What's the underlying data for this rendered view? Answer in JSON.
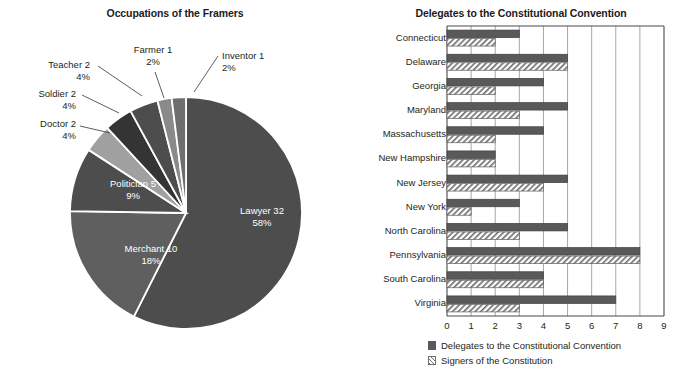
{
  "chart_data": [
    {
      "type": "pie",
      "title": "Occupations of the Framers",
      "categories": [
        "Lawyer",
        "Merchant",
        "Politician",
        "Doctor",
        "Soldier",
        "Teacher",
        "Farmer",
        "Inventor"
      ],
      "values": [
        32,
        10,
        5,
        2,
        2,
        2,
        1,
        1
      ],
      "percents": [
        "58%",
        "18%",
        "9%",
        "4%",
        "4%",
        "4%",
        "2%",
        "2%"
      ],
      "slices": [
        {
          "label": "Lawyer 32",
          "percent": "58%",
          "name": "Lawyer",
          "value": 32,
          "pct": 58,
          "color": "#4d4d4d",
          "placement": "inside"
        },
        {
          "label": "Merchant 10",
          "percent": "18%",
          "name": "Merchant",
          "value": 10,
          "pct": 18,
          "color": "#5f5f5f",
          "placement": "inside"
        },
        {
          "label": "Politician 5",
          "percent": "9%",
          "name": "Politician",
          "value": 5,
          "pct": 9,
          "color": "#4d4d4d",
          "placement": "inside"
        },
        {
          "label": "Doctor 2",
          "percent": "4%",
          "name": "Doctor",
          "value": 2,
          "pct": 4,
          "color": "#a0a0a0",
          "placement": "outside"
        },
        {
          "label": "Soldier 2",
          "percent": "4%",
          "name": "Soldier",
          "value": 2,
          "pct": 4,
          "color": "#343434",
          "placement": "outside"
        },
        {
          "label": "Teacher 2",
          "percent": "4%",
          "name": "Teacher",
          "value": 2,
          "pct": 4,
          "color": "#4d4d4d",
          "placement": "outside"
        },
        {
          "label": "Farmer 1",
          "percent": "2%",
          "name": "Farmer",
          "value": 1,
          "pct": 2,
          "color": "#8a8a8a",
          "placement": "outside"
        },
        {
          "label": "Inventor 1",
          "percent": "2%",
          "name": "Inventor",
          "value": 1,
          "pct": 2,
          "color": "#6e6e6e",
          "placement": "outside"
        }
      ],
      "xlabel": "",
      "ylabel": "",
      "legend": "none"
    },
    {
      "type": "bar",
      "orientation": "horizontal",
      "title": "Delegates to the Constitutional Convention",
      "categories": [
        "Connecticut",
        "Delaware",
        "Georgia",
        "Maryland",
        "Massachusetts",
        "New Hampshire",
        "New Jersey",
        "New York",
        "North Carolina",
        "Pennsylvania",
        "South Carolina",
        "Virginia"
      ],
      "series": [
        {
          "name": "Delegates to the Constitutional Convention",
          "style": "solid",
          "color": "#595959",
          "values": [
            3,
            5,
            4,
            5,
            4,
            2,
            5,
            3,
            5,
            8,
            4,
            7
          ]
        },
        {
          "name": "Signers of the Constitution",
          "style": "hatch",
          "color": "#6b6b6b",
          "values": [
            2,
            5,
            2,
            3,
            2,
            2,
            4,
            1,
            3,
            8,
            4,
            3
          ]
        }
      ],
      "xticks": [
        "0",
        "1",
        "2",
        "3",
        "4",
        "5",
        "6",
        "7",
        "8",
        "9"
      ],
      "xlim": [
        0,
        9
      ],
      "xlabel": "",
      "ylabel": "",
      "grid": "vertical",
      "legend_position": "bottom-left",
      "legend": [
        {
          "label": "Delegates to the Constitutional Convention",
          "style": "solid"
        },
        {
          "label": "Signers of the Constitution",
          "style": "hatch"
        }
      ]
    }
  ]
}
